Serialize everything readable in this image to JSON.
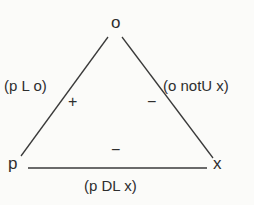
{
  "diagram": {
    "type": "balance-triangle",
    "nodes": [
      {
        "id": "o",
        "label": "o",
        "position": "top"
      },
      {
        "id": "p",
        "label": "p",
        "position": "bottom-left"
      },
      {
        "id": "x",
        "label": "x",
        "position": "bottom-right"
      }
    ],
    "edges": [
      {
        "from": "p",
        "to": "o",
        "relation": "(p L o)",
        "sign": "+"
      },
      {
        "from": "o",
        "to": "x",
        "relation": "(o notU x)",
        "sign": "−"
      },
      {
        "from": "p",
        "to": "x",
        "relation": "(p DL x)",
        "sign": "−"
      }
    ],
    "colors": {
      "line": "#3a3a3a",
      "text": "#2e2e2e",
      "background": "#fbfbf9"
    }
  }
}
